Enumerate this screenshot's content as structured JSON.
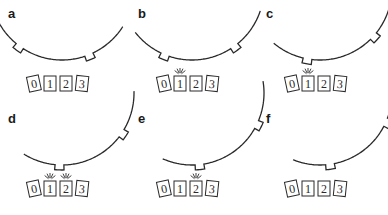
{
  "figure": {
    "sensor_labels": [
      "0",
      "1",
      "2",
      "3"
    ],
    "panels": [
      {
        "label": "a",
        "x": 0,
        "y": 0,
        "rotation": -4,
        "active": []
      },
      {
        "label": "b",
        "x": 130,
        "y": 0,
        "rotation": 10,
        "active": [
          1
        ]
      },
      {
        "label": "c",
        "x": 258,
        "y": 0,
        "rotation": 22,
        "active": [
          1
        ]
      },
      {
        "label": "d",
        "x": 0,
        "y": 105,
        "rotation": 30,
        "active": [
          1,
          2
        ]
      },
      {
        "label": "e",
        "x": 130,
        "y": 105,
        "rotation": 38,
        "active": [
          2
        ]
      },
      {
        "label": "f",
        "x": 258,
        "y": 105,
        "rotation": 40,
        "active": []
      }
    ]
  },
  "colors": {
    "stroke": "#2a2a2a",
    "background": "#ffffff"
  }
}
